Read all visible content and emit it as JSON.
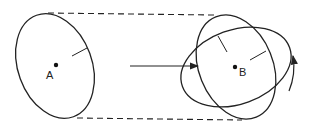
{
  "diagram": {
    "colors": {
      "stroke": "#222222",
      "background": "#ffffff"
    },
    "labels": {
      "point_a": "A",
      "point_b": "B"
    },
    "elements": {
      "left_ellipse": {
        "cx": 55,
        "cy": 66,
        "rx": 37,
        "ry": 54,
        "rotate": -20
      },
      "right_ellipse_1": {
        "cx": 236,
        "cy": 67,
        "rx": 37,
        "ry": 54,
        "rotate": -20
      },
      "right_ellipse_2": {
        "cx": 236,
        "cy": 67,
        "rx": 55,
        "ry": 37,
        "rotate": -20
      },
      "transform_arrow": "right-arrow",
      "rotation_arrow": "curved-up-arrow"
    }
  }
}
